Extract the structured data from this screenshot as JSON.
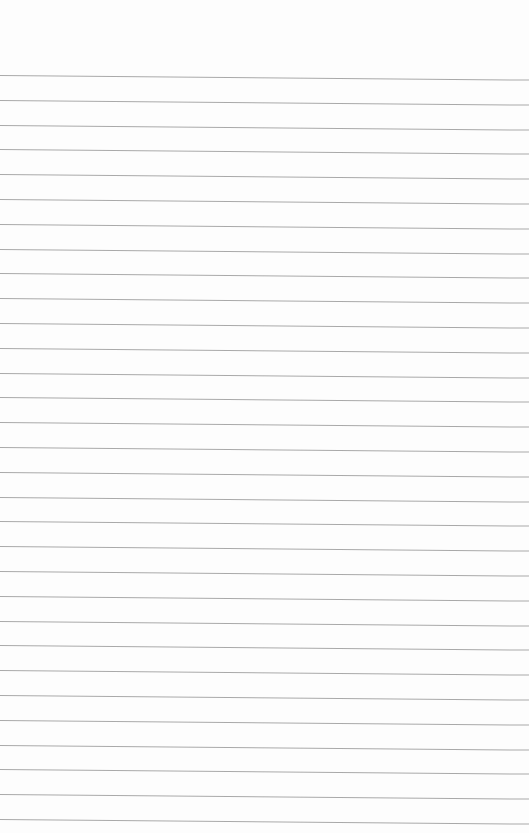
{
  "page": {
    "type": "lined-paper",
    "background": "#fdfdfd",
    "line_color": "#a9a9a9",
    "line_count": 31,
    "first_line_y": 75,
    "line_spacing": 24.8
  }
}
